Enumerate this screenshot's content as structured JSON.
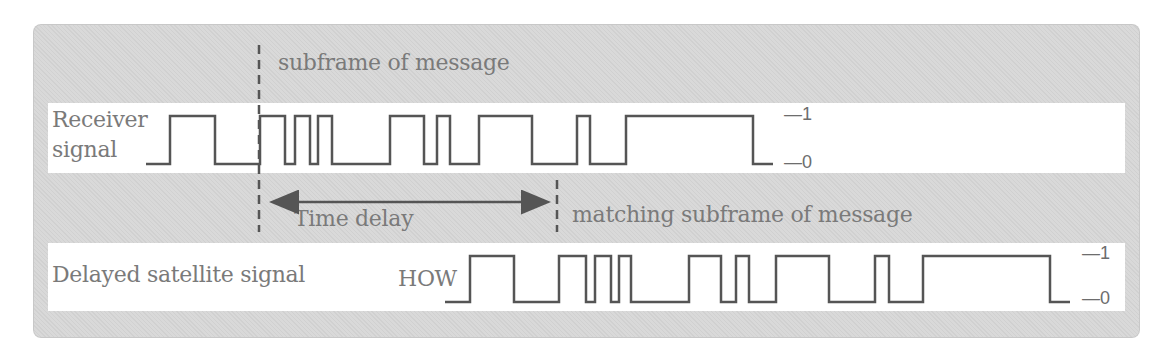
{
  "diagram": {
    "title_annotation": "subframe of message",
    "receiver": {
      "label_line1": "Receiver",
      "label_line2": "signal",
      "level_high": "1",
      "level_low": "0",
      "edges_x": [
        146,
        170,
        215,
        260,
        285,
        295,
        310,
        318,
        332,
        390,
        424,
        437,
        450,
        479,
        532,
        577,
        590,
        626,
        753,
        773
      ],
      "start_level": 0
    },
    "time_delay_label": "Time delay",
    "matching_annotation": "matching subframe of message",
    "satellite": {
      "label": "Delayed satellite signal",
      "marker": "HOW",
      "level_high": "1",
      "level_low": "0",
      "edges_x": [
        445,
        470,
        514,
        559,
        586,
        595,
        611,
        619,
        631,
        689,
        721,
        736,
        749,
        776,
        829,
        875,
        889,
        923,
        1050,
        1070
      ],
      "start_level": 0
    },
    "colors": {
      "panel": "#d9d9d9",
      "strip": "#ffffff",
      "waveform": "#555555",
      "text": "#7a7a7a"
    }
  }
}
